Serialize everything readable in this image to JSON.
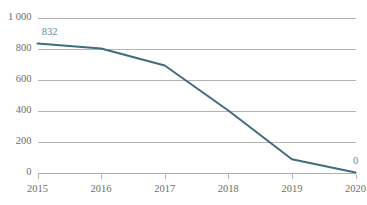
{
  "chart_data": {
    "type": "line",
    "title": "",
    "subtitle": "",
    "xlabel": "",
    "ylabel": "",
    "categories": [
      "2015",
      "2016",
      "2017",
      "2018",
      "2019",
      "2020"
    ],
    "x": [
      2015,
      2016,
      2017,
      2018,
      2019,
      2020
    ],
    "values": [
      832,
      800,
      690,
      400,
      85,
      0
    ],
    "series": [
      {
        "name": "",
        "values": [
          832,
          800,
          690,
          400,
          85,
          0
        ],
        "color": "#3e6d7c"
      }
    ],
    "ylim": [
      0,
      1000
    ],
    "xlim": [
      2015,
      2020
    ],
    "y_ticks": [
      0,
      200,
      400,
      600,
      800,
      1000
    ],
    "y_tick_labels": [
      "0",
      "200",
      "400",
      "600",
      "800",
      "1 000"
    ],
    "x_tick_labels": [
      "2015",
      "2016",
      "2017",
      "2018",
      "2019",
      "2020"
    ],
    "grid": {
      "horizontal": true,
      "vertical": false,
      "color": "#b4b4b4"
    },
    "legend": {
      "visible": false,
      "position": "none",
      "entries": []
    },
    "point_labels": [
      {
        "category": "2015",
        "value": 832,
        "text": "832",
        "color": "#5b8ba0"
      },
      {
        "category": "2020",
        "value": 0,
        "text": "0",
        "color": "#5b8ba0"
      }
    ],
    "axis": {
      "tick_marks": true,
      "tick_color": "#b4b4b4",
      "label_color": "#6e6e6e",
      "baseline_color": "#b0b0b0"
    },
    "colors": {
      "background": "#ffffff",
      "line": "#3e6d7c",
      "data_label": "#5b8ba0",
      "grid": "#b4b4b4",
      "tick_text": "#6e6e6e"
    }
  }
}
